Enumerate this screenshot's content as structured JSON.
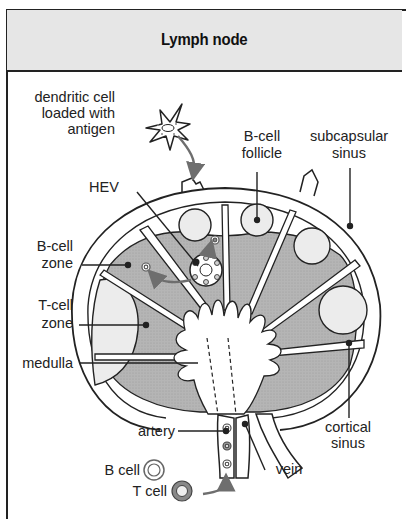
{
  "header": {
    "title": "Lymph node"
  },
  "labels": {
    "dendritic_cell": [
      "dendritic cell",
      "loaded with",
      "antigen"
    ],
    "b_cell_follicle": [
      "B-cell",
      "follicle"
    ],
    "subcapsular_sinus": [
      "subcapsular",
      "sinus"
    ],
    "hev": "HEV",
    "b_cell_zone": [
      "B-cell",
      "zone"
    ],
    "t_cell_zone": [
      "T-cell",
      "zone"
    ],
    "medulla": "medulla",
    "cortical_sinus": [
      "cortical",
      "sinus"
    ],
    "artery": "artery",
    "vein": "vein"
  },
  "legend": {
    "b_cell": "B cell",
    "t_cell": "T cell"
  },
  "colors": {
    "header_bg": "#e6e6e6",
    "zone_gray": "#b3b3b3",
    "follicle": "#ececec",
    "arrow": "#6e6e6e",
    "line": "#222222"
  }
}
